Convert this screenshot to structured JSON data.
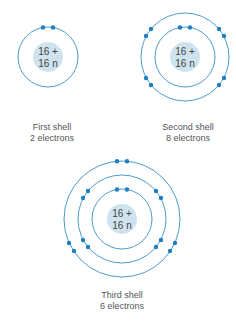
{
  "colors": {
    "orbit": "#3a8fc4",
    "electron": "#1e7fc0",
    "nucleus": "#cfe3ee",
    "text": "#555555"
  },
  "atoms": [
    {
      "id": "first",
      "nucleus": {
        "line1": "16 +",
        "line2": "16 n"
      },
      "caption": {
        "line1": "First shell",
        "line2": "2 electrons"
      }
    },
    {
      "id": "second",
      "nucleus": {
        "line1": "16 +",
        "line2": "16 n"
      },
      "caption": {
        "line1": "Second shell",
        "line2": "8 electrons"
      }
    },
    {
      "id": "third",
      "nucleus": {
        "line1": "16 +",
        "line2": "16 n"
      },
      "caption": {
        "line1": "Third shell",
        "line2": "6 electrons"
      }
    }
  ]
}
